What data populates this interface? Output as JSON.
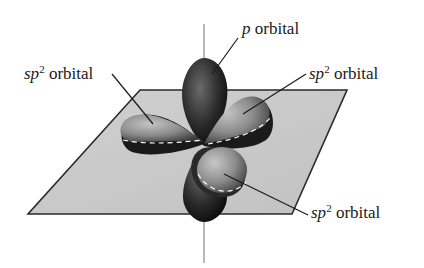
{
  "figure": {
    "colors": {
      "plane_fill": "#c9c9c9",
      "plane_edge": "#2a2a2a",
      "axis_line": "#8a8a8a",
      "lobe_dark": "#1a1a1a",
      "lobe_mid": "#6d6d6d",
      "lobe_light": "#b5b5b5",
      "dash_line": "#ffffff",
      "leader_line": "#1a1a1a",
      "text": "#1a1a1a"
    }
  },
  "labels": {
    "p_orbital": {
      "italic": "p",
      "sup": "",
      "text": " orbital"
    },
    "sp2_left": {
      "italic": "sp",
      "sup": "2",
      "text": " orbital"
    },
    "sp2_right": {
      "italic": "sp",
      "sup": "2",
      "text": " orbital"
    },
    "sp2_bottom": {
      "italic": "sp",
      "sup": "2",
      "text": " orbital"
    }
  }
}
